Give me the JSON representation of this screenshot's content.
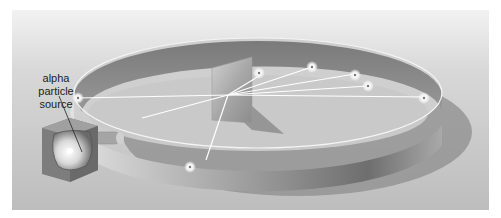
{
  "diagram": {
    "title": "",
    "labels": {
      "source_line1": "alpha",
      "source_line2": "particle",
      "source_line3": "source"
    },
    "components": [
      {
        "id": "alpha-source",
        "description": "lead box with radioactive source"
      },
      {
        "id": "collimator-tube",
        "description": "tube emitting alpha beam"
      },
      {
        "id": "gold-foil",
        "description": "thin metal foil target"
      },
      {
        "id": "detector-ring",
        "description": "circular fluorescent screen"
      },
      {
        "id": "flashes",
        "description": "scintillation flashes where particles strike the screen"
      }
    ],
    "colors": {
      "background_top": "#e6e6e6",
      "background_bottom": "#c0c0c0",
      "ring_inner": "#8a8a8a",
      "ring_outer": "#d4d4d4",
      "beam": "#ffffff"
    }
  }
}
